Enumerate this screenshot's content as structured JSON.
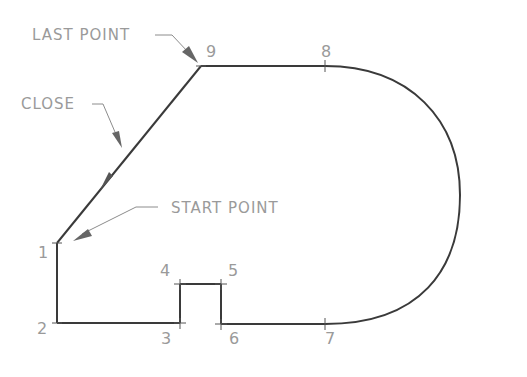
{
  "diagram": {
    "colors": {
      "outline": "#3a3a3a",
      "leader": "#8c8c8c",
      "text": "#9a9a9a",
      "background": "#ffffff"
    },
    "annotations": {
      "last_point": "LAST POINT",
      "close": "CLOSE",
      "start_point": "START POINT"
    },
    "vertices": [
      {
        "id": "1",
        "label": "1",
        "x": 57,
        "y": 243
      },
      {
        "id": "2",
        "label": "2",
        "x": 57,
        "y": 323
      },
      {
        "id": "3",
        "label": "3",
        "x": 180,
        "y": 323
      },
      {
        "id": "4",
        "label": "4",
        "x": 180,
        "y": 284
      },
      {
        "id": "5",
        "label": "5",
        "x": 221,
        "y": 284
      },
      {
        "id": "6",
        "label": "6",
        "x": 221,
        "y": 324
      },
      {
        "id": "7",
        "label": "7",
        "x": 325,
        "y": 324
      },
      {
        "id": "8",
        "label": "8",
        "x": 325,
        "y": 66
      },
      {
        "id": "9",
        "label": "9",
        "x": 201,
        "y": 66
      }
    ],
    "segments": [
      {
        "from": "1",
        "to": "2",
        "type": "line"
      },
      {
        "from": "2",
        "to": "3",
        "type": "line"
      },
      {
        "from": "3",
        "to": "4",
        "type": "line"
      },
      {
        "from": "4",
        "to": "5",
        "type": "line"
      },
      {
        "from": "5",
        "to": "6",
        "type": "line"
      },
      {
        "from": "6",
        "to": "7",
        "type": "line"
      },
      {
        "from": "7",
        "to": "8",
        "type": "arc"
      },
      {
        "from": "8",
        "to": "9",
        "type": "line"
      },
      {
        "from": "9",
        "to": "1",
        "type": "close"
      }
    ]
  }
}
